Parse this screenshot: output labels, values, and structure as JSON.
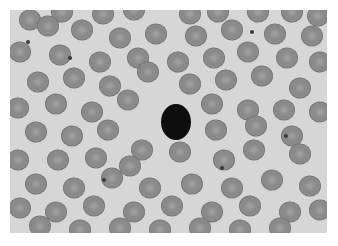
{
  "image": {
    "subject": "blood smear micrograph",
    "description": "Grayscale microscope image of red blood cells with a single dark-stained cell near center",
    "colors": {
      "background": "#d6d6d6",
      "cell_fill": "#8a8a8a",
      "cell_edge": "#6a6a6a",
      "cell_center": "#a4a4a4",
      "dark_cell": "#0e0e0e",
      "page": "#ffffff"
    },
    "dark_cell": {
      "cx": 176,
      "cy": 122,
      "rx": 15,
      "ry": 18
    },
    "cells": [
      [
        30,
        20
      ],
      [
        62,
        12
      ],
      [
        103,
        14
      ],
      [
        134,
        10
      ],
      [
        190,
        14
      ],
      [
        218,
        12
      ],
      [
        258,
        12
      ],
      [
        292,
        12
      ],
      [
        318,
        16
      ],
      [
        48,
        26
      ],
      [
        82,
        30
      ],
      [
        120,
        38
      ],
      [
        156,
        34
      ],
      [
        196,
        36
      ],
      [
        232,
        30
      ],
      [
        275,
        34
      ],
      [
        312,
        36
      ],
      [
        20,
        52
      ],
      [
        60,
        55
      ],
      [
        100,
        62
      ],
      [
        138,
        58
      ],
      [
        178,
        62
      ],
      [
        214,
        58
      ],
      [
        248,
        52
      ],
      [
        287,
        58
      ],
      [
        320,
        62
      ],
      [
        38,
        82
      ],
      [
        74,
        78
      ],
      [
        110,
        86
      ],
      [
        148,
        72
      ],
      [
        190,
        84
      ],
      [
        226,
        80
      ],
      [
        262,
        76
      ],
      [
        300,
        88
      ],
      [
        18,
        108
      ],
      [
        56,
        104
      ],
      [
        92,
        112
      ],
      [
        128,
        100
      ],
      [
        212,
        104
      ],
      [
        248,
        110
      ],
      [
        284,
        110
      ],
      [
        320,
        112
      ],
      [
        36,
        132
      ],
      [
        72,
        136
      ],
      [
        108,
        130
      ],
      [
        142,
        150
      ],
      [
        216,
        130
      ],
      [
        256,
        126
      ],
      [
        292,
        136
      ],
      [
        18,
        160
      ],
      [
        58,
        160
      ],
      [
        96,
        158
      ],
      [
        130,
        166
      ],
      [
        180,
        152
      ],
      [
        224,
        160
      ],
      [
        254,
        150
      ],
      [
        300,
        154
      ],
      [
        36,
        184
      ],
      [
        74,
        188
      ],
      [
        112,
        178
      ],
      [
        150,
        188
      ],
      [
        192,
        184
      ],
      [
        232,
        188
      ],
      [
        272,
        180
      ],
      [
        310,
        186
      ],
      [
        20,
        208
      ],
      [
        56,
        212
      ],
      [
        94,
        206
      ],
      [
        134,
        212
      ],
      [
        172,
        206
      ],
      [
        212,
        212
      ],
      [
        250,
        206
      ],
      [
        290,
        212
      ],
      [
        320,
        210
      ],
      [
        40,
        226
      ],
      [
        80,
        230
      ],
      [
        120,
        228
      ],
      [
        160,
        230
      ],
      [
        200,
        228
      ],
      [
        240,
        230
      ],
      [
        280,
        228
      ]
    ],
    "debris": [
      [
        28,
        42
      ],
      [
        70,
        58
      ],
      [
        104,
        180
      ],
      [
        252,
        32
      ],
      [
        286,
        136
      ],
      [
        222,
        168
      ]
    ]
  }
}
